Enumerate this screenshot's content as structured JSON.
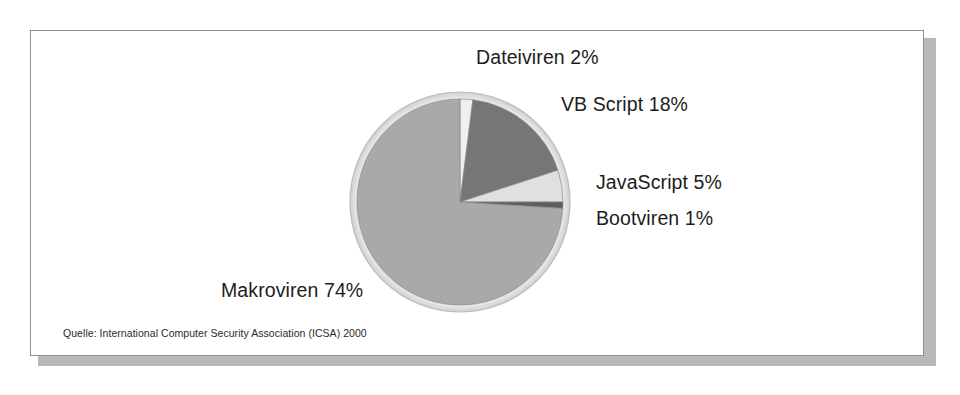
{
  "figure": {
    "source_note": "Quelle: International Computer Security Association (ICSA) 2000",
    "frame_border_color": "#8d8f91",
    "shadow_color": "#b6b8ba",
    "background_color": "#ffffff"
  },
  "chart_data": {
    "type": "pie",
    "title": "",
    "subtitle": "",
    "xlabel": "",
    "ylabel": "",
    "legend_position": "none",
    "grid": false,
    "units": "percent",
    "start_angle_deg": 0,
    "direction": "clockwise",
    "categories": [
      "Dateiviren",
      "VB Script",
      "JavaScript",
      "Bootviren",
      "Makroviren"
    ],
    "values": [
      2,
      18,
      5,
      1,
      74
    ],
    "labels": [
      "Dateiviren 2%",
      "VB Script 18%",
      "JavaScript 5%",
      "Bootviren 1%",
      "Makroviren 74%"
    ],
    "colors": [
      "#efefef",
      "#767676",
      "#e0e0e0",
      "#5e5e5e",
      "#a9a9a9"
    ],
    "slices": [
      {
        "name": "Dateiviren",
        "value": 2,
        "label": "Dateiviren 2%",
        "color": "#efefef"
      },
      {
        "name": "VB Script",
        "value": 18,
        "label": "VB Script 18%",
        "color": "#767676"
      },
      {
        "name": "JavaScript",
        "value": 5,
        "label": "JavaScript 5%",
        "color": "#e0e0e0"
      },
      {
        "name": "Bootviren",
        "value": 1,
        "label": "Bootviren 1%",
        "color": "#5e5e5e"
      },
      {
        "name": "Makroviren",
        "value": 74,
        "label": "Makroviren 74%",
        "color": "#a9a9a9"
      }
    ]
  }
}
